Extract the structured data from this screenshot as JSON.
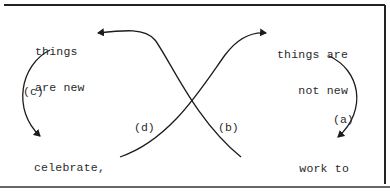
{
  "diagram": {
    "type": "cycle-figure-eight",
    "nodes": {
      "top_left": {
        "line1": "things",
        "line2": "are new"
      },
      "top_right": {
        "line1": "things are",
        "line2": "not new"
      },
      "bottom_right": {
        "line1": "work to",
        "line2": "change things"
      },
      "bottom_left": {
        "line1": "celebrate,",
        "line2": "perpetuate",
        "line3": "achievements"
      }
    },
    "edges": [
      {
        "id": "a",
        "label": "(a)",
        "from": "things are not new",
        "to": "work to change things"
      },
      {
        "id": "b",
        "label": "(b)",
        "from": "work to change things",
        "to": "things are new"
      },
      {
        "id": "c",
        "label": "(c)",
        "from": "things are new",
        "to": "celebrate, perpetuate achievements"
      },
      {
        "id": "d",
        "label": "(d)",
        "from": "celebrate, perpetuate achievements",
        "to": "things are not new"
      }
    ],
    "colors": {
      "stroke": "#1c1c1c",
      "text": "#2a2a2a",
      "background": "#ffffff"
    }
  }
}
